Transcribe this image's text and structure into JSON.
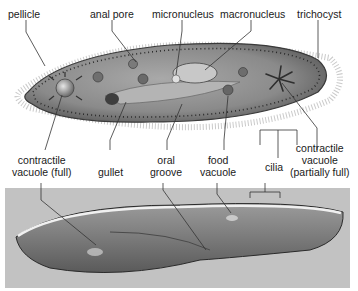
{
  "figure": {
    "top_panel": "labeled illustration",
    "bottom_panel": "micrograph"
  },
  "labels": {
    "pellicle": "pellicle",
    "anal_pore": "anal pore",
    "micronucleus": "micronucleus",
    "macronucleus": "macronucleus",
    "trichocyst": "trichocyst",
    "contractile_vacuole_full_1": "contractile",
    "contractile_vacuole_full_2": "vacuole (full)",
    "gullet": "gullet",
    "oral_groove_1": "oral",
    "oral_groove_2": "groove",
    "food_vacuole_1": "food",
    "food_vacuole_2": "vacuole",
    "cilia": "cilia",
    "contractile_vacuole_partial_1": "contractile",
    "contractile_vacuole_partial_2": "vacuole",
    "contractile_vacuole_partial_3": "(partially full)"
  },
  "colors": {
    "label_text": "#1a1a1a",
    "leader_line": "#333333",
    "cell_body": "#8c8c8c",
    "cell_edge": "#3a3a3a",
    "photo_bg": "#c2c2c2"
  }
}
